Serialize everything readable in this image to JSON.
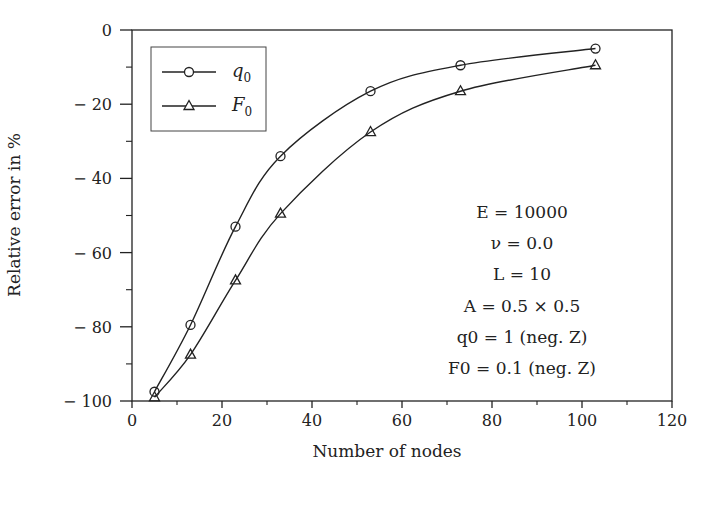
{
  "chart_data": {
    "type": "line",
    "title": "",
    "xlabel": "Number of nodes",
    "ylabel": "Relative error in %",
    "xlim": [
      0,
      120
    ],
    "ylim": [
      -100,
      0
    ],
    "xticks": [
      0,
      20,
      40,
      60,
      80,
      100,
      120
    ],
    "yticks": [
      0,
      -20,
      -40,
      -60,
      -80,
      -100
    ],
    "xtick_labels": [
      "0",
      "20",
      "40",
      "60",
      "80",
      "100",
      "120"
    ],
    "ytick_labels": [
      "0",
      "− 20",
      "− 40",
      "− 60",
      "− 80",
      "− 100"
    ],
    "grid": false,
    "legend_position": "upper left",
    "series": [
      {
        "name": "q0",
        "label_main": "q",
        "label_sub": "0",
        "marker": "circle",
        "x": [
          5,
          13,
          23,
          33,
          53,
          73,
          103
        ],
        "values": [
          -97.5,
          -79.5,
          -53,
          -34,
          -16.5,
          -9.5,
          -5
        ]
      },
      {
        "name": "F0",
        "label_main": "F",
        "label_sub": "0",
        "marker": "triangle",
        "x": [
          5,
          13,
          23,
          33,
          53,
          73,
          103
        ],
        "values": [
          -99,
          -87.5,
          -67.5,
          -49.5,
          -27.5,
          -16.5,
          -9.5
        ]
      }
    ],
    "annotations": [
      "E = 10000",
      "ν = 0.0",
      "L = 10",
      "A = 0.5 × 0.5",
      "q0 = 1 (neg. Z)",
      "F0 = 0.1 (neg. Z)"
    ]
  },
  "colors": {
    "line": "#222222",
    "background": "#ffffff"
  }
}
